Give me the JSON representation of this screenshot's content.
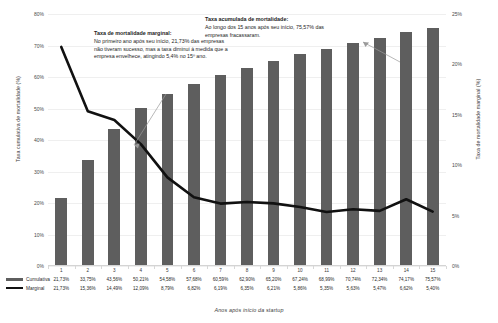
{
  "axes": {
    "y_left_title": "Taxa cumulativa de mortalidade (%)",
    "y_right_title": "Taxa de mortalidade marginal (%)",
    "x_title": "Anos após início da startup",
    "y_left_ticks": [
      "80%",
      "70%",
      "60%",
      "50%",
      "40%",
      "30%",
      "20%",
      "10%",
      "0%"
    ],
    "y_right_ticks": [
      "25%",
      "20%",
      "15%",
      "10%",
      "5%",
      "0%"
    ]
  },
  "annotations": {
    "marginal": {
      "heading": "Taxa de mortalidade marginal:",
      "body": "No primeiro ano após seu início, 21,73% das empresas não tiveram sucesso, mas a taxa diminui à medida que a empresa envelhece, atingindo 5,4% no 15º ano."
    },
    "cumulative": {
      "heading": "Taxa acumulada de mortalidade:",
      "body": "Ao longo dos 15 anos após seu início, 75,57% das empresas fracassaram."
    }
  },
  "legend": {
    "cumulative_label": "Cumulativa",
    "marginal_label": "Marginal"
  },
  "chart_data": {
    "type": "bar",
    "title": "",
    "xlabel": "Anos após início da startup",
    "ylabel": "Taxa cumulativa de mortalidade (%)",
    "ylabel_secondary": "Taxa de mortalidade marginal (%)",
    "ylim": [
      0,
      80
    ],
    "ylim_secondary": [
      0,
      25
    ],
    "grid": true,
    "legend_position": "bottom-left",
    "categories": [
      "1",
      "2",
      "3",
      "4",
      "5",
      "6",
      "7",
      "8",
      "9",
      "10",
      "11",
      "12",
      "13",
      "14",
      "15"
    ],
    "series": [
      {
        "name": "Cumulativa",
        "type": "bar",
        "axis": "left",
        "color": "#5e5e5e",
        "values": [
          21.73,
          33.75,
          43.56,
          50.21,
          54.58,
          57.68,
          60.59,
          62.9,
          65.2,
          67.24,
          68.99,
          70.74,
          72.34,
          74.17,
          75.57
        ],
        "labels": [
          "21,73%",
          "33,75%",
          "43,56%",
          "50,21%",
          "54,58%",
          "57,68%",
          "60,59%",
          "62,90%",
          "65,20%",
          "67,24%",
          "68,99%",
          "70,74%",
          "72,34%",
          "74,17%",
          "75,57%"
        ]
      },
      {
        "name": "Marginal",
        "type": "line",
        "axis": "right",
        "color": "#111111",
        "values": [
          21.73,
          15.36,
          14.49,
          12.09,
          8.79,
          6.82,
          6.19,
          6.35,
          6.21,
          5.86,
          5.35,
          5.63,
          5.47,
          6.62,
          5.4
        ],
        "labels": [
          "21,73%",
          "15,36%",
          "14,49%",
          "12,09%",
          "8,79%",
          "6,82%",
          "6,19%",
          "6,35%",
          "6,21%",
          "5,86%",
          "5,35%",
          "5,63%",
          "5,47%",
          "6,62%",
          "5,40%"
        ]
      }
    ]
  }
}
